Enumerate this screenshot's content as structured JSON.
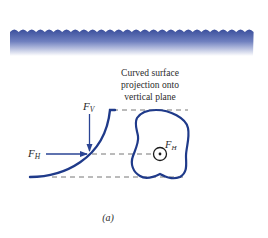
{
  "figure": {
    "annotation_lines": [
      "Curved surface",
      "projection onto",
      "vertical plane"
    ],
    "labels": {
      "vertical_force": {
        "main": "F",
        "sub": "V"
      },
      "horizontal_force": {
        "main": "F",
        "sub": "H"
      },
      "projected_force": {
        "main": "F",
        "sub": "H"
      }
    },
    "caption": "(a)",
    "colors": {
      "water_top": "#3a4f9a",
      "water_bottom": "#ffffff",
      "curve": "#1f3a8a",
      "arrow": "#2a4494",
      "dash": "#777777",
      "text": "#2b2b2b"
    }
  }
}
